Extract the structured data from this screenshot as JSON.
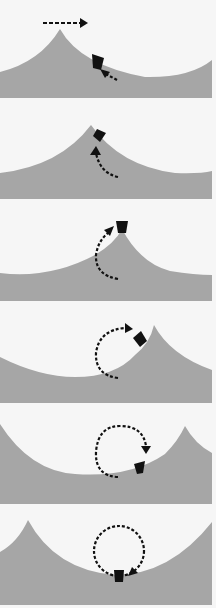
{
  "diagram": {
    "type": "sequence-of-panels",
    "colors": {
      "background": "#f6f6f6",
      "surface": "#a6a6a6",
      "object": "#111111",
      "arrow": "#111111"
    },
    "panels": [
      {
        "index": 1,
        "top": 0,
        "peak_x": 60,
        "object": {
          "x": 96,
          "y": 64,
          "rot": 25
        },
        "arrows": "horizontal-top + diagonal-up-left"
      },
      {
        "index": 2,
        "top": 101,
        "peak_x": 91,
        "object": {
          "x": 101,
          "y": 34,
          "rot": 35
        },
        "arrows": "curve-up"
      },
      {
        "index": 3,
        "top": 203,
        "peak_x": 122,
        "object": {
          "x": 122,
          "y": 22,
          "rot": 0
        },
        "arrows": "arc-up-right"
      },
      {
        "index": 4,
        "top": 305,
        "peak_x": 154,
        "object": {
          "x": 141,
          "y": 36,
          "rot": 40
        },
        "arrows": "arc-over-top"
      },
      {
        "index": 5,
        "top": 406,
        "peak_x": 185,
        "object": {
          "x": 139,
          "y": 60,
          "rot": -10
        },
        "arrows": "arc-down-right"
      },
      {
        "index": 6,
        "top": 507,
        "peak_x": 28,
        "object": {
          "x": 118,
          "y": 70,
          "rot": 0
        },
        "arrows": "full-circle-down-left"
      }
    ]
  }
}
